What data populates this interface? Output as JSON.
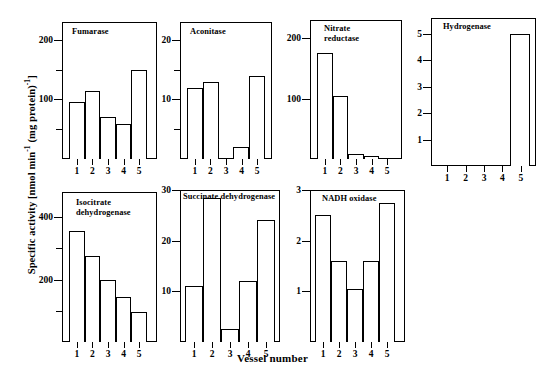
{
  "figure": {
    "ylabel_text": "Specific activity [nmol min",
    "ylabel_sup1": "-1",
    "ylabel_mid": " (mg protein)",
    "ylabel_sup2": "-1",
    "ylabel_end": "]",
    "xlabel": "Vessel number",
    "background": "#ffffff",
    "ink": "#000000"
  },
  "chart_data": [
    {
      "type": "bar",
      "title": "Fumarase",
      "categories": [
        "1",
        "2",
        "3",
        "4",
        "5"
      ],
      "values": [
        95,
        115,
        70,
        58,
        150
      ],
      "xlabel": "Vessel number",
      "ylabel": "Specific activity [nmol min-1 (mg protein)-1]",
      "ylim": [
        0,
        230
      ],
      "yticks": [
        50,
        100,
        150,
        200
      ],
      "ytick_labels": [
        "",
        "100",
        "",
        "200"
      ],
      "grid": false,
      "legend": "none"
    },
    {
      "type": "bar",
      "title": "Aconitase",
      "categories": [
        "1",
        "2",
        "3",
        "4",
        "5"
      ],
      "values": [
        12,
        13,
        0,
        2,
        14
      ],
      "xlabel": "Vessel number",
      "ylabel": "Specific activity [nmol min-1 (mg protein)-1]",
      "ylim": [
        0,
        23
      ],
      "yticks": [
        5,
        10,
        15,
        20
      ],
      "ytick_labels": [
        "",
        "10",
        "",
        "20"
      ],
      "grid": false,
      "legend": "none"
    },
    {
      "type": "bar",
      "title": "Nitrate\nreductase",
      "categories": [
        "1",
        "2",
        "3",
        "4",
        "5"
      ],
      "values": [
        175,
        105,
        8,
        5,
        2
      ],
      "xlabel": "Vessel number",
      "ylabel": "Specific activity [nmol min-1 (mg protein)-1]",
      "ylim": [
        0,
        230
      ],
      "yticks": [
        100,
        200
      ],
      "ytick_labels": [
        "100",
        "200"
      ],
      "grid": false,
      "legend": "none"
    },
    {
      "type": "bar",
      "title": "Hydrogenase",
      "categories": [
        "1",
        "2",
        "3",
        "4",
        "5"
      ],
      "values": [
        0,
        0,
        0,
        0,
        5
      ],
      "xlabel": "Vessel number",
      "ylabel": "Specific activity [nmol min-1 (mg protein)-1]",
      "ylim": [
        0,
        5.6
      ],
      "yticks": [
        1,
        2,
        3,
        4,
        5
      ],
      "ytick_labels": [
        "1",
        "2",
        "3",
        "4",
        "5"
      ],
      "grid": false,
      "legend": "none"
    },
    {
      "type": "bar",
      "title": "Isocitrate\ndehydrogenase",
      "categories": [
        "1",
        "2",
        "3",
        "4",
        "5"
      ],
      "values": [
        355,
        275,
        200,
        145,
        95
      ],
      "xlabel": "Vessel number",
      "ylabel": "Specific activity [nmol min-1 (mg protein)-1]",
      "ylim": [
        0,
        480
      ],
      "yticks": [
        100,
        200,
        300,
        400
      ],
      "ytick_labels": [
        "",
        "200",
        "",
        "400"
      ],
      "grid": false,
      "legend": "none"
    },
    {
      "type": "bar",
      "title": "Succinate dehydrogenase",
      "categories": [
        "1",
        "2",
        "3",
        "4",
        "5"
      ],
      "values": [
        11,
        28.5,
        2.5,
        12,
        24
      ],
      "xlabel": "Vessel number",
      "ylabel": "Specific activity [nmol min-1 (mg protein)-1]",
      "ylim": [
        0,
        30
      ],
      "yticks": [
        10,
        20,
        30
      ],
      "ytick_labels": [
        "10",
        "20",
        "30"
      ],
      "grid": false,
      "legend": "none"
    },
    {
      "type": "bar",
      "title": "NADH oxidase",
      "categories": [
        "1",
        "2",
        "3",
        "4",
        "5"
      ],
      "values": [
        2.5,
        1.6,
        1.05,
        1.6,
        2.75
      ],
      "xlabel": "Vessel number",
      "ylabel": "Specific activity [nmol min-1 (mg protein)-1]",
      "ylim": [
        0,
        3
      ],
      "yticks": [
        1,
        2,
        3
      ],
      "ytick_labels": [
        "1",
        "2",
        "3"
      ],
      "grid": false,
      "legend": "none"
    }
  ],
  "panels": [
    {
      "key": "fumarase",
      "title": "Fumarase"
    },
    {
      "key": "aconitase",
      "title": "Aconitase"
    },
    {
      "key": "nitrate-reductase",
      "title": "Nitrate\nreductase"
    },
    {
      "key": "hydrogenase",
      "title": "Hydrogenase"
    },
    {
      "key": "isocitrate-dehydrogenase",
      "title": "Isocitrate\ndehydrogenase"
    },
    {
      "key": "succinate-dehydrogenase",
      "title": "Succinate dehydrogenase"
    },
    {
      "key": "nadh-oxidase",
      "title": "NADH oxidase"
    }
  ]
}
